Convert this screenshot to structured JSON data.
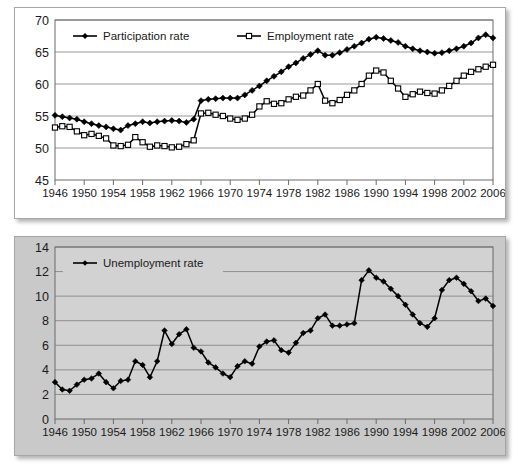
{
  "figure": {
    "background": "#ffffff",
    "panel_top_background": "#ffffff",
    "panel_bottom_background": "#c9c9c9",
    "line_color": "#000000",
    "grid_color": "#7d7d7d"
  },
  "chart_data": [
    {
      "type": "line",
      "title": "",
      "subtitle": "",
      "xlabel": "",
      "ylabel": "",
      "xlim": [
        1946,
        2006
      ],
      "ylim": [
        45,
        70
      ],
      "ytick_labels": [
        "45",
        "50",
        "55",
        "60",
        "65",
        "70"
      ],
      "yticks": [
        45,
        50,
        55,
        60,
        65,
        70
      ],
      "xtick_labels": [
        "1946",
        "1950",
        "1954",
        "1958",
        "1962",
        "1966",
        "1970",
        "1974",
        "1978",
        "1982",
        "1986",
        "1990",
        "1994",
        "1998",
        "2002",
        "2006"
      ],
      "xticks": [
        1946,
        1950,
        1954,
        1958,
        1962,
        1966,
        1970,
        1974,
        1978,
        1982,
        1986,
        1990,
        1994,
        1998,
        2002,
        2006
      ],
      "grid": true,
      "legend_position": "top-left-inside",
      "legend": [
        "Participation rate",
        "Employment rate"
      ],
      "x": [
        1946,
        1947,
        1948,
        1949,
        1950,
        1951,
        1952,
        1953,
        1954,
        1955,
        1956,
        1957,
        1958,
        1959,
        1960,
        1961,
        1962,
        1963,
        1964,
        1965,
        1966,
        1967,
        1968,
        1969,
        1970,
        1971,
        1972,
        1973,
        1974,
        1975,
        1976,
        1977,
        1978,
        1979,
        1980,
        1981,
        1982,
        1983,
        1984,
        1985,
        1986,
        1987,
        1988,
        1989,
        1990,
        1991,
        1992,
        1993,
        1994,
        1995,
        1996,
        1997,
        1998,
        1999,
        2000,
        2001,
        2002,
        2003,
        2004,
        2005,
        2006
      ],
      "series": [
        {
          "name": "Participation rate",
          "marker": "filled-diamond",
          "values": [
            55.1,
            54.9,
            54.7,
            54.5,
            54.1,
            53.8,
            53.5,
            53.3,
            53.0,
            52.8,
            53.5,
            53.8,
            54.1,
            53.9,
            54.1,
            54.2,
            54.3,
            54.2,
            54.0,
            54.5,
            57.4,
            57.6,
            57.7,
            57.8,
            57.8,
            57.8,
            58.3,
            59.0,
            59.7,
            60.5,
            61.2,
            61.9,
            62.7,
            63.3,
            64.0,
            64.6,
            65.2,
            64.5,
            64.5,
            64.9,
            65.4,
            65.9,
            66.4,
            67.0,
            67.3,
            67.1,
            66.8,
            66.5,
            65.9,
            65.5,
            65.2,
            65.0,
            64.8,
            64.9,
            65.2,
            65.5,
            65.9,
            66.4,
            67.2,
            67.7,
            67.2
          ]
        },
        {
          "name": "Employment rate",
          "marker": "open-square",
          "values": [
            53.2,
            53.4,
            53.3,
            52.6,
            52.0,
            52.2,
            51.9,
            51.5,
            50.4,
            50.3,
            50.5,
            51.7,
            50.9,
            50.2,
            50.4,
            50.3,
            50.1,
            50.2,
            50.6,
            51.2,
            55.4,
            55.5,
            55.2,
            55.0,
            54.6,
            54.4,
            54.6,
            55.2,
            56.5,
            57.3,
            56.9,
            57.0,
            57.6,
            58.0,
            58.2,
            59.0,
            60.0,
            57.4,
            57.0,
            57.5,
            58.3,
            59.0,
            60.0,
            61.3,
            62.1,
            61.8,
            60.5,
            59.3,
            58.0,
            58.4,
            58.8,
            58.6,
            58.5,
            59.0,
            59.7,
            60.5,
            61.3,
            61.9,
            62.3,
            62.7,
            63.0
          ]
        }
      ]
    },
    {
      "type": "line",
      "title": "",
      "subtitle": "",
      "xlabel": "",
      "ylabel": "",
      "xlim": [
        1946,
        2006
      ],
      "ylim": [
        0,
        14
      ],
      "ytick_labels": [
        "0",
        "2",
        "4",
        "6",
        "8",
        "10",
        "12",
        "14"
      ],
      "yticks": [
        0,
        2,
        4,
        6,
        8,
        10,
        12,
        14
      ],
      "xtick_labels": [
        "1946",
        "1950",
        "1954",
        "1958",
        "1962",
        "1966",
        "1970",
        "1974",
        "1978",
        "1982",
        "1986",
        "1990",
        "1994",
        "1998",
        "2002",
        "2006"
      ],
      "xticks": [
        1946,
        1950,
        1954,
        1958,
        1962,
        1966,
        1970,
        1974,
        1978,
        1982,
        1986,
        1990,
        1994,
        1998,
        2002,
        2006
      ],
      "grid": true,
      "legend_position": "top-left-inside",
      "legend": [
        "Unemployment rate"
      ],
      "x": [
        1946,
        1947,
        1948,
        1949,
        1950,
        1951,
        1952,
        1953,
        1954,
        1955,
        1956,
        1957,
        1958,
        1959,
        1960,
        1961,
        1962,
        1963,
        1964,
        1965,
        1966,
        1967,
        1968,
        1969,
        1970,
        1971,
        1972,
        1973,
        1974,
        1975,
        1976,
        1977,
        1978,
        1979,
        1980,
        1981,
        1982,
        1983,
        1984,
        1985,
        1986,
        1987,
        1988,
        1989,
        1990,
        1991,
        1992,
        1993,
        1994,
        1995,
        1996,
        1997,
        1998,
        1999,
        2000,
        2001,
        2002,
        2003,
        2004,
        2005,
        2006
      ],
      "series": [
        {
          "name": "Unemployment rate",
          "marker": "filled-diamond",
          "values": [
            3.0,
            2.4,
            2.3,
            2.8,
            3.2,
            3.3,
            3.7,
            3.0,
            2.5,
            3.1,
            3.2,
            4.7,
            4.4,
            3.4,
            4.7,
            7.2,
            6.1,
            6.9,
            7.3,
            5.8,
            5.5,
            4.6,
            4.2,
            3.7,
            3.4,
            4.3,
            4.7,
            4.5,
            5.9,
            6.3,
            6.4,
            5.6,
            5.4,
            6.2,
            7.0,
            7.2,
            8.2,
            8.5,
            7.6,
            7.6,
            7.7,
            7.8,
            11.3,
            12.1,
            11.5,
            11.2,
            10.6,
            10.0,
            9.3,
            8.5,
            7.8,
            7.5,
            8.2,
            10.5,
            11.3,
            11.5,
            11.0,
            10.4,
            9.6,
            9.8,
            9.2,
            8.5,
            7.8,
            7.0,
            7.2,
            7.8,
            7.7,
            7.4,
            7.1,
            6.8,
            6.4
          ]
        }
      ]
    }
  ]
}
